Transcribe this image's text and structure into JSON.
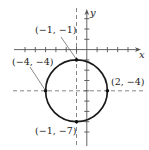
{
  "figure": {
    "type": "circle-graph",
    "axes": {
      "x_label": "x",
      "y_label": "y"
    },
    "circle": {
      "center": [
        -1,
        -4
      ],
      "radius": 3,
      "equation_hint": "(x+1)^2 + (y+4)^2 = 9"
    },
    "points": [
      {
        "id": "top",
        "label": "(−1, −1)",
        "x": -1,
        "y": -1
      },
      {
        "id": "left",
        "label": "(−4, −4)",
        "x": -4,
        "y": -4
      },
      {
        "id": "right",
        "label": "(2, −4)",
        "x": 2,
        "y": -4
      },
      {
        "id": "bottom",
        "label": "(−1, −7)",
        "x": -1,
        "y": -7
      }
    ],
    "guides": {
      "vertical_dashed_x": -1,
      "horizontal_dashed_y": -4
    },
    "colors": {
      "curve": "#1a1a1a",
      "axis": "#555555",
      "dashed": "#777777",
      "text": "#222222"
    }
  }
}
